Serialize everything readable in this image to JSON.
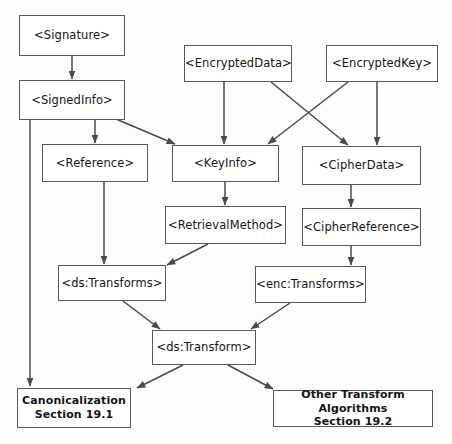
{
  "diagram": {
    "type": "flow-diagram",
    "canvas": {
      "width": 452,
      "height": 444
    },
    "style": {
      "background_color": "#fdfdfd",
      "box_fill_color": "#ffffff",
      "box_border_color": "#585858",
      "text_color": "#141414",
      "arrow_color": "#4a4a4a"
    },
    "nodes": [
      {
        "id": "signature",
        "label": "<Signature>",
        "x": 19,
        "y": 15,
        "w": 106,
        "h": 41,
        "bold": false
      },
      {
        "id": "signedinfo",
        "label": "<SignedInfo>",
        "x": 19,
        "y": 80,
        "w": 106,
        "h": 40,
        "bold": false
      },
      {
        "id": "encrypteddata",
        "label": "<EncryptedData>",
        "x": 184,
        "y": 45,
        "w": 108,
        "h": 37,
        "bold": false
      },
      {
        "id": "encryptedkey",
        "label": "<EncryptedKey>",
        "x": 326,
        "y": 45,
        "w": 112,
        "h": 37,
        "bold": false
      },
      {
        "id": "reference",
        "label": "<Reference>",
        "x": 42,
        "y": 144,
        "w": 106,
        "h": 38,
        "bold": false
      },
      {
        "id": "keyinfo",
        "label": "<KeyInfo>",
        "x": 172,
        "y": 145,
        "w": 107,
        "h": 37,
        "bold": false
      },
      {
        "id": "cipherdata",
        "label": "<CipherData>",
        "x": 302,
        "y": 146,
        "w": 119,
        "h": 39,
        "bold": false
      },
      {
        "id": "retrievalmethod",
        "label": "<RetrievalMethod>",
        "x": 165,
        "y": 206,
        "w": 121,
        "h": 38,
        "bold": false
      },
      {
        "id": "cipherreference",
        "label": "<CipherReference>",
        "x": 302,
        "y": 208,
        "w": 119,
        "h": 38,
        "bold": false
      },
      {
        "id": "dstransforms",
        "label": "<ds:Transforms>",
        "x": 58,
        "y": 265,
        "w": 108,
        "h": 36,
        "bold": false
      },
      {
        "id": "enctransforms",
        "label": "<enc:Transforms>",
        "x": 255,
        "y": 266,
        "w": 111,
        "h": 37,
        "bold": false
      },
      {
        "id": "dstransform",
        "label": "<ds:Transform>",
        "x": 152,
        "y": 330,
        "w": 104,
        "h": 35,
        "bold": false
      },
      {
        "id": "canonicalization",
        "label": "Canonicalization\nSection 19.1",
        "x": 17,
        "y": 388,
        "w": 114,
        "h": 40,
        "bold": true
      },
      {
        "id": "othertransform",
        "label": "Other Transform Algorithms\nSection 19.2",
        "x": 273,
        "y": 390,
        "w": 160,
        "h": 37,
        "bold": true
      }
    ],
    "edges": [
      {
        "id": "e-signature-signedinfo",
        "from": "signature",
        "to": "signedinfo",
        "x1": 72,
        "y1": 56,
        "x2": 72,
        "y2": 79
      },
      {
        "id": "e-signedinfo-reference",
        "from": "signedinfo",
        "to": "reference",
        "x1": 95,
        "y1": 120,
        "x2": 95,
        "y2": 143
      },
      {
        "id": "e-signedinfo-keyinfo",
        "from": "signedinfo",
        "to": "keyinfo",
        "x1": 116,
        "y1": 119,
        "x2": 175,
        "y2": 144
      },
      {
        "id": "e-signedinfo-canonicalization",
        "from": "signedinfo",
        "to": "canonicalization",
        "x1": 30,
        "y1": 120,
        "x2": 30,
        "y2": 386
      },
      {
        "id": "e-encrypteddata-keyinfo",
        "from": "encrypteddata",
        "to": "keyinfo",
        "x1": 224,
        "y1": 82,
        "x2": 224,
        "y2": 144
      },
      {
        "id": "e-encrypteddata-cipherdata",
        "from": "encrypteddata",
        "to": "cipherdata",
        "x1": 271,
        "y1": 82,
        "x2": 348,
        "y2": 145
      },
      {
        "id": "e-encryptedkey-keyinfo",
        "from": "encryptedkey",
        "to": "keyinfo",
        "x1": 348,
        "y1": 82,
        "x2": 268,
        "y2": 144
      },
      {
        "id": "e-encryptedkey-cipherdata",
        "from": "encryptedkey",
        "to": "cipherdata",
        "x1": 377,
        "y1": 82,
        "x2": 377,
        "y2": 145
      },
      {
        "id": "e-reference-dstransforms",
        "from": "reference",
        "to": "dstransforms",
        "x1": 104,
        "y1": 182,
        "x2": 104,
        "y2": 264
      },
      {
        "id": "e-keyinfo-retrievalmethod",
        "from": "keyinfo",
        "to": "retrievalmethod",
        "x1": 225,
        "y1": 182,
        "x2": 225,
        "y2": 205
      },
      {
        "id": "e-cipherdata-cipherreference",
        "from": "cipherdata",
        "to": "cipherreference",
        "x1": 351,
        "y1": 185,
        "x2": 351,
        "y2": 207
      },
      {
        "id": "e-retrievalmethod-dstransforms",
        "from": "retrievalmethod",
        "to": "dstransforms",
        "x1": 208,
        "y1": 244,
        "x2": 167,
        "y2": 265
      },
      {
        "id": "e-cipherreference-enctransforms",
        "from": "cipherreference",
        "to": "enctransforms",
        "x1": 351,
        "y1": 246,
        "x2": 351,
        "y2": 265
      },
      {
        "id": "e-dstransforms-dstransform",
        "from": "dstransforms",
        "to": "dstransform",
        "x1": 123,
        "y1": 301,
        "x2": 160,
        "y2": 329
      },
      {
        "id": "e-enctransforms-dstransform",
        "from": "enctransforms",
        "to": "dstransform",
        "x1": 290,
        "y1": 303,
        "x2": 251,
        "y2": 329
      },
      {
        "id": "e-dstransform-canonicalization",
        "from": "dstransform",
        "to": "canonicalization",
        "x1": 183,
        "y1": 365,
        "x2": 137,
        "y2": 388
      },
      {
        "id": "e-dstransform-othertransform",
        "from": "dstransform",
        "to": "othertransform",
        "x1": 228,
        "y1": 365,
        "x2": 273,
        "y2": 389
      }
    ]
  }
}
